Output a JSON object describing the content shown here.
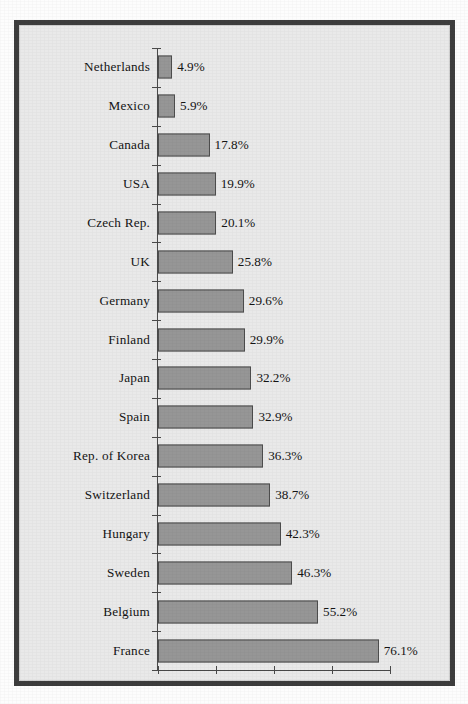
{
  "chart_data": {
    "type": "bar",
    "orientation": "horizontal",
    "title": "",
    "xlabel": "",
    "ylabel": "",
    "grid": false,
    "legend": false,
    "xlim": [
      0,
      80
    ],
    "x_tick_labels": [],
    "x_tick_values": [
      0,
      20,
      40,
      60,
      80
    ],
    "value_suffix": "%",
    "categories": [
      "Netherlands",
      "Mexico",
      "Canada",
      "USA",
      "Czech Rep.",
      "UK",
      "Germany",
      "Finland",
      "Japan",
      "Spain",
      "Rep. of Korea",
      "Switzerland",
      "Hungary",
      "Sweden",
      "Belgium",
      "France"
    ],
    "values": [
      4.9,
      5.9,
      17.8,
      19.9,
      20.1,
      25.8,
      29.6,
      29.9,
      32.2,
      32.9,
      36.3,
      38.7,
      42.3,
      46.3,
      55.2,
      76.1
    ],
    "value_labels": [
      "4.9%",
      "5.9%",
      "17.8%",
      "19.9%",
      "20.1%",
      "25.8%",
      "29.6%",
      "29.9%",
      "32.2%",
      "32.9%",
      "36.3%",
      "38.7%",
      "42.3%",
      "46.3%",
      "55.2%",
      "76.1%"
    ]
  },
  "style": {
    "bar_fill": "#969696",
    "bar_stroke": "#4d4d4d",
    "panel_background": "#e9e9e9",
    "frame_border": "#3d3d3d",
    "axis_color": "#4a4a4a",
    "text_color": "#141414",
    "page_background": "#fdfdfd"
  }
}
